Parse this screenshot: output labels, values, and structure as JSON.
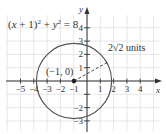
{
  "figure": {
    "equation": {
      "lhs_open": "(",
      "x": "x",
      "plus1": " + 1)",
      "sq1": "2",
      "plus": " + ",
      "y": "y",
      "sq2": "2",
      "rhs": " = 8"
    },
    "center_label": "(−1, 0)",
    "radius_label_prefix": "2",
    "radius_label_sqrt": "√2",
    "radius_label_suffix": " units",
    "x_axis_label": "x",
    "y_axis_label": "y",
    "x_ticks": [
      "−5",
      "−4",
      "−3",
      "−2",
      "−1",
      "1",
      "2",
      "3",
      "4"
    ],
    "y_ticks": [
      "4",
      "3",
      "2",
      "1",
      "−1",
      "−2",
      "−3"
    ],
    "colors": {
      "grid": "#d8d8d8",
      "axis": "#333333",
      "circle": "#555555",
      "text": "#333333"
    }
  },
  "chart_data": {
    "type": "diagram",
    "shape": "circle",
    "center": [
      -1,
      0
    ],
    "radius": 2.8284,
    "radius_label": "2√2 units",
    "xlabel": "x",
    "ylabel": "y",
    "xlim": [
      -6,
      5
    ],
    "ylim": [
      -4,
      5
    ],
    "x_tick_values": [
      -5,
      -4,
      -3,
      -2,
      -1,
      1,
      2,
      3,
      4
    ],
    "y_tick_values": [
      -3,
      -2,
      -1,
      1,
      2,
      3,
      4
    ],
    "grid": true,
    "annotations": [
      {
        "text": "(−1, 0)",
        "at": [
          -1,
          0
        ],
        "marker": "filled-dot"
      },
      {
        "text": "2√2 units",
        "type": "dashed-radius"
      }
    ]
  }
}
